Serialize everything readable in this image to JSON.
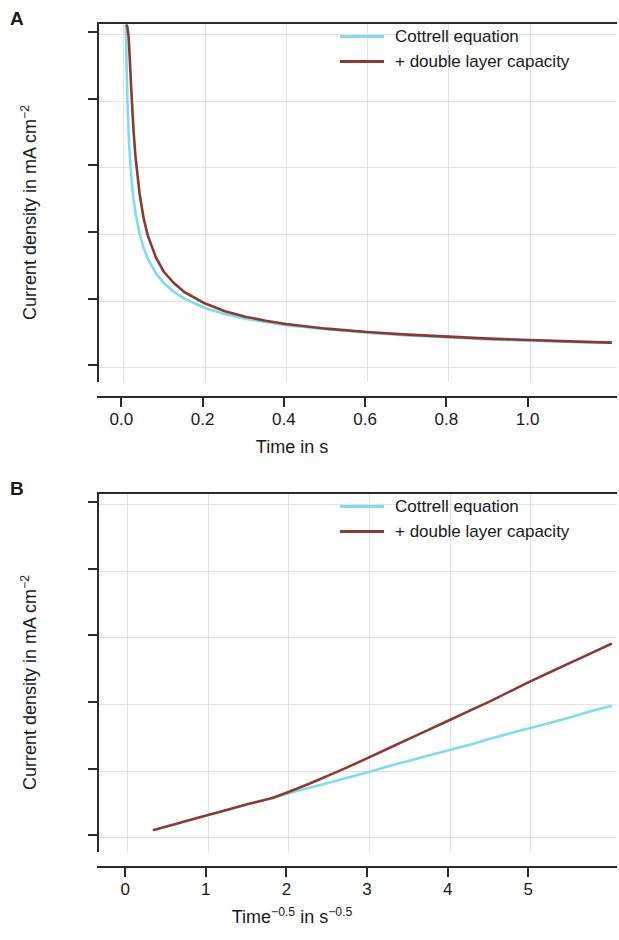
{
  "figure": {
    "panels": [
      {
        "letter": "A",
        "xlabel_main": "Time in s",
        "xlabel_parts": {
          "base": "Time",
          "exp": "",
          "mid": "in s",
          "exp2": ""
        },
        "ylabel_base": "Current density in mA cm",
        "ylabel_exp": "−2",
        "xticks": [
          "0.0",
          "0.2",
          "0.4",
          "0.6",
          "0.8",
          "1.0"
        ],
        "xtick_values": [
          0.0,
          0.2,
          0.4,
          0.6,
          0.8,
          1.0
        ],
        "yticks": [
          "0",
          "10",
          "20",
          "30",
          "40",
          "50"
        ],
        "ytick_values": [
          0,
          10,
          20,
          30,
          40,
          50
        ],
        "legend": [
          {
            "label": "Cottrell equation",
            "color": "#7fdbed"
          },
          {
            "label": "+ double layer capacity",
            "color": "#8b3a32"
          }
        ]
      },
      {
        "letter": "B",
        "xlabel_main": "Time−0.5 in s−0.5",
        "xlabel_parts": {
          "base": "Time",
          "exp": "−0.5",
          "mid": "in s",
          "exp2": "−0.5"
        },
        "ylabel_base": "Current density in mA cm",
        "ylabel_exp": "−2",
        "xticks": [
          "0",
          "1",
          "2",
          "3",
          "4",
          "5"
        ],
        "xtick_values": [
          0,
          1,
          2,
          3,
          4,
          5
        ],
        "yticks": [
          "0",
          "10",
          "20",
          "30",
          "40",
          "50"
        ],
        "ytick_values": [
          0,
          10,
          20,
          30,
          40,
          50
        ],
        "legend": [
          {
            "label": "Cottrell equation",
            "color": "#7fdbed"
          },
          {
            "label": "+ double layer capacity",
            "color": "#8b3a32"
          }
        ]
      }
    ]
  },
  "chart_data": [
    {
      "type": "line",
      "panel": "A",
      "title": "",
      "xlabel": "Time in s",
      "ylabel": "Current density in mA cm^-2",
      "xlim": [
        -0.06,
        1.22
      ],
      "ylim": [
        -2.5,
        51.5
      ],
      "grid": true,
      "legend_position": "top-right-inside",
      "xticks": [
        0.0,
        0.2,
        0.4,
        0.6,
        0.8,
        1.0
      ],
      "yticks": [
        0,
        10,
        20,
        30,
        40,
        50
      ],
      "series": [
        {
          "name": "Cottrell equation",
          "color": "#7fdbed",
          "x": [
            0.006,
            0.008,
            0.01,
            0.013,
            0.016,
            0.02,
            0.025,
            0.03,
            0.04,
            0.05,
            0.06,
            0.08,
            0.1,
            0.125,
            0.15,
            0.2,
            0.25,
            0.3,
            0.35,
            0.4,
            0.5,
            0.6,
            0.7,
            0.8,
            0.9,
            1.0,
            1.1,
            1.2
          ],
          "y": [
            51.2,
            44.7,
            40.0,
            35.1,
            31.6,
            28.3,
            25.3,
            23.1,
            20.0,
            17.9,
            16.3,
            14.1,
            12.6,
            11.3,
            10.3,
            8.9,
            8.0,
            7.3,
            6.8,
            6.3,
            5.7,
            5.2,
            4.8,
            4.5,
            4.2,
            4.0,
            3.8,
            3.7
          ]
        },
        {
          "name": "+ double layer capacity",
          "color": "#8b3a32",
          "x": [
            0.008,
            0.01,
            0.013,
            0.016,
            0.02,
            0.025,
            0.03,
            0.04,
            0.05,
            0.06,
            0.08,
            0.1,
            0.125,
            0.15,
            0.2,
            0.25,
            0.3,
            0.35,
            0.4,
            0.5,
            0.6,
            0.7,
            0.8,
            0.9,
            1.0,
            1.1,
            1.2
          ],
          "y": [
            51.3,
            51.0,
            49.5,
            46.0,
            41.0,
            35.5,
            31.5,
            26.0,
            22.3,
            19.8,
            16.5,
            14.3,
            12.6,
            11.3,
            9.6,
            8.4,
            7.6,
            7.0,
            6.5,
            5.8,
            5.3,
            4.9,
            4.6,
            4.3,
            4.1,
            3.9,
            3.7
          ]
        }
      ]
    },
    {
      "type": "line",
      "panel": "B",
      "title": "",
      "xlabel": "Time^-0.5 in s^-0.5",
      "ylabel": "Current density in mA cm^-2",
      "xlim": [
        -0.35,
        6.1
      ],
      "ylim": [
        -2.5,
        51.5
      ],
      "grid": true,
      "legend_position": "top-right-inside",
      "xticks": [
        0,
        1,
        2,
        3,
        4,
        5
      ],
      "yticks": [
        0,
        10,
        20,
        30,
        40,
        50
      ],
      "series": [
        {
          "name": "Cottrell equation",
          "color": "#7fdbed",
          "x": [
            1.8,
            2.0,
            2.25,
            2.5,
            2.75,
            3.0,
            3.25,
            3.5,
            3.75,
            4.0,
            4.25,
            4.5,
            4.75,
            5.0,
            5.25,
            5.5,
            5.75,
            6.0
          ],
          "y": [
            5.9,
            6.6,
            7.4,
            8.2,
            9.0,
            9.8,
            10.7,
            11.5,
            12.3,
            13.1,
            13.9,
            14.8,
            15.6,
            16.4,
            17.2,
            18.0,
            18.9,
            19.7
          ]
        },
        {
          "name": "+ double layer capacity",
          "color": "#8b3a32",
          "x": [
            0.33,
            0.6,
            0.9,
            1.2,
            1.5,
            1.8,
            2.0,
            2.25,
            2.5,
            2.75,
            3.0,
            3.25,
            3.5,
            3.75,
            4.0,
            4.25,
            4.5,
            4.75,
            5.0,
            5.25,
            5.5,
            5.75,
            6.0
          ],
          "y": [
            1.1,
            2.0,
            3.0,
            4.0,
            5.0,
            5.9,
            6.8,
            8.0,
            9.3,
            10.6,
            12.0,
            13.4,
            14.8,
            16.2,
            17.6,
            19.0,
            20.4,
            21.9,
            23.4,
            24.8,
            26.2,
            27.6,
            29.0
          ]
        }
      ]
    }
  ]
}
